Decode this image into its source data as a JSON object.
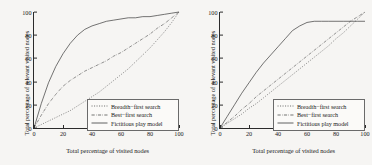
{
  "figure": {
    "panels": [
      {
        "id": "left-panel",
        "axis": {
          "xlabel": "Total percentage of visited nodes",
          "ylabel": "Total percentage of relevant visited nodes",
          "xticks": [
            "0",
            "20",
            "40",
            "60",
            "80",
            "100"
          ],
          "yticks": [
            "0",
            "20",
            "40",
            "60",
            "80",
            "100"
          ]
        },
        "legend": [
          {
            "label": "Breadth−first search",
            "style": "dotted"
          },
          {
            "label": "Best−first search",
            "style": "dashdot"
          },
          {
            "label": "Fictitious play model",
            "style": "solid"
          }
        ]
      },
      {
        "id": "right-panel",
        "axis": {
          "xlabel": "Total percentage of visited nodes",
          "ylabel": "Total percentage of relevant visited nodes",
          "xticks": [
            "0",
            "20",
            "40",
            "60",
            "80",
            "100"
          ],
          "yticks": [
            "0",
            "20",
            "40",
            "60",
            "80",
            "100"
          ]
        },
        "legend": [
          {
            "label": "Breadth−first search",
            "style": "dotted"
          },
          {
            "label": "Best−first search",
            "style": "dashdot"
          },
          {
            "label": "Fictitious play model",
            "style": "solid"
          }
        ]
      }
    ],
    "colors": {
      "axis": "#2b2b2b",
      "curve": "#3a3a3a",
      "background": "#f6f5f3",
      "legend_border": "#6a6a6a"
    }
  },
  "chart_data": [
    {
      "type": "line",
      "title": "",
      "xlabel": "Total percentage of visited nodes",
      "ylabel": "Total percentage of relevant visited nodes",
      "xlim": [
        0,
        100
      ],
      "ylim": [
        0,
        100
      ],
      "grid": false,
      "legend_position": "lower right",
      "x": [
        0,
        5,
        10,
        15,
        20,
        25,
        30,
        35,
        40,
        45,
        50,
        55,
        60,
        65,
        70,
        75,
        80,
        85,
        90,
        95,
        100
      ],
      "series": [
        {
          "name": "Breadth−first search",
          "style": "dotted",
          "values": [
            0,
            3,
            6,
            9,
            12,
            15,
            19,
            23,
            27,
            31,
            36,
            41,
            46,
            51,
            57,
            63,
            69,
            76,
            83,
            91,
            100
          ]
        },
        {
          "name": "Best−first search",
          "style": "dashdot",
          "values": [
            0,
            11,
            21,
            29,
            36,
            41,
            45,
            49,
            52,
            55,
            58,
            62,
            65,
            69,
            73,
            77,
            81,
            86,
            90,
            95,
            100
          ]
        },
        {
          "name": "Fictitious play model",
          "style": "solid",
          "values": [
            0,
            21,
            39,
            53,
            64,
            73,
            80,
            85,
            88,
            90,
            92,
            93,
            94,
            95,
            95,
            96,
            96,
            97,
            98,
            99,
            100
          ]
        }
      ]
    },
    {
      "type": "line",
      "title": "",
      "xlabel": "Total percentage of visited nodes",
      "ylabel": "Total percentage of relevant visited nodes",
      "xlim": [
        0,
        100
      ],
      "ylim": [
        0,
        100
      ],
      "grid": false,
      "legend_position": "lower right",
      "x": [
        0,
        5,
        10,
        15,
        20,
        25,
        30,
        35,
        40,
        45,
        50,
        55,
        60,
        65,
        70,
        75,
        80,
        85,
        90,
        95,
        100
      ],
      "series": [
        {
          "name": "Breadth−first search",
          "style": "dotted",
          "values": [
            0,
            4,
            8,
            12,
            17,
            21,
            26,
            31,
            36,
            41,
            46,
            51,
            56,
            61,
            66,
            71,
            77,
            82,
            88,
            94,
            100
          ]
        },
        {
          "name": "Best−first search",
          "style": "dashdot",
          "values": [
            0,
            5,
            10,
            16,
            21,
            27,
            32,
            37,
            42,
            47,
            52,
            57,
            62,
            67,
            72,
            77,
            82,
            87,
            92,
            96,
            100
          ]
        },
        {
          "name": "Fictitious play model",
          "style": "solid",
          "values": [
            0,
            10,
            20,
            30,
            39,
            48,
            56,
            63,
            70,
            77,
            84,
            88,
            91,
            92,
            92,
            92,
            92,
            92,
            92,
            92,
            92
          ]
        }
      ]
    }
  ]
}
